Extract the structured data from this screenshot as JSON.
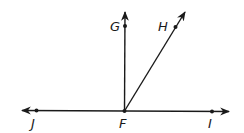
{
  "diagram": {
    "type": "geometry-rays",
    "stroke_color": "#1a1a1a",
    "points": {
      "F": {
        "label": "F",
        "x": 124,
        "y": 111
      },
      "G": {
        "label": "G",
        "x": 125,
        "y": 26
      },
      "H": {
        "label": "H",
        "x": 175,
        "y": 27
      },
      "I": {
        "label": "I",
        "x": 212,
        "y": 111
      },
      "J": {
        "label": "J",
        "x": 36,
        "y": 111
      }
    },
    "rays": [
      {
        "name": "ray-FG",
        "from": "F",
        "through": "G"
      },
      {
        "name": "ray-FH",
        "from": "F",
        "through": "H"
      },
      {
        "name": "ray-FI",
        "from": "F",
        "through": "I"
      },
      {
        "name": "ray-FJ",
        "from": "F",
        "through": "J"
      }
    ]
  }
}
